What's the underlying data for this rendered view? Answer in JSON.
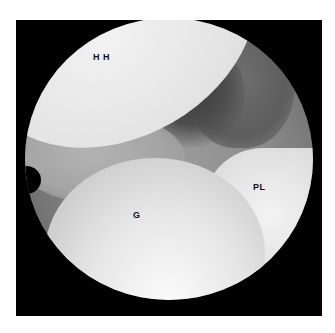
{
  "image": {
    "description": "Arthroscopic view of shoulder joint with anatomical labels",
    "labels": {
      "humeral_head": "H H",
      "superior_glenohumeral_ligament": "SGL",
      "biceps_tendon": "BT",
      "anterior_labrum": "AL",
      "glenoid": "G",
      "posterior_labrum": "PL"
    }
  }
}
